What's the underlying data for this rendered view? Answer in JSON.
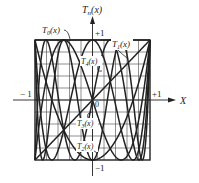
{
  "chart_data": {
    "type": "line",
    "title": "",
    "xlabel": "X",
    "ylabel": "T_n(x)",
    "xlim": [
      -1,
      1
    ],
    "ylim": [
      -1,
      1
    ],
    "grid": true,
    "grid_divisions": 10,
    "tick_labels": {
      "x_min": "− 1",
      "x_max": "+1",
      "y_max": "+1",
      "y_min": "−1",
      "origin": "0"
    },
    "series": [
      {
        "name": "T0(x)",
        "label": "T",
        "sub": "0",
        "degree": 0,
        "formula": "1"
      },
      {
        "name": "T1(x)",
        "label": "T",
        "sub": "1",
        "degree": 1,
        "formula": "x"
      },
      {
        "name": "T2(x)",
        "label": "T",
        "sub": "2",
        "degree": 2,
        "formula": "2x^2-1"
      },
      {
        "name": "T3(x)",
        "label": "T",
        "sub": "3",
        "degree": 3,
        "formula": "4x^3-3x"
      },
      {
        "name": "T4(x)",
        "label": "T",
        "sub": "4",
        "degree": 4,
        "formula": "8x^4-8x^2+1"
      },
      {
        "name": "T5(x)",
        "degree": 5,
        "formula": "16x^5-20x^3+5x"
      },
      {
        "name": "T6(x)",
        "degree": 6,
        "formula": "32x^6-48x^4+18x^2-1"
      }
    ],
    "annotations": [
      {
        "text": "T0(x)",
        "x": -0.55,
        "y": 1.15
      },
      {
        "text": "T1(x)",
        "x": 0.75,
        "y": 0.8
      },
      {
        "text": "T4(x)",
        "x": 0.05,
        "y": 0.55
      },
      {
        "text": "T3(x)",
        "x": -0.1,
        "y": -0.45
      },
      {
        "text": "T2(x)",
        "x": -0.15,
        "y": -0.85
      }
    ]
  },
  "labels": {
    "y_axis": "T",
    "y_axis_sub": "n",
    "y_axis_arg": "(x)",
    "x_axis": "X",
    "x_min": "− 1",
    "x_max": "+1",
    "y_max": "+1",
    "y_min": "−1",
    "origin": "0",
    "t0": "T",
    "t0_sub": "0",
    "t0_arg": "(x)",
    "t1": "T",
    "t1_sub": "1",
    "t1_arg": "(x)",
    "t2": "T",
    "t2_sub": "2",
    "t2_arg": "(x)",
    "t3": "T",
    "t3_sub": "3",
    "t3_arg": "(x)",
    "t4": "T",
    "t4_sub": "4",
    "t4_arg": "(x)"
  },
  "colors": {
    "ink": "#222222",
    "grid": "#444444",
    "background": "#ffffff"
  }
}
